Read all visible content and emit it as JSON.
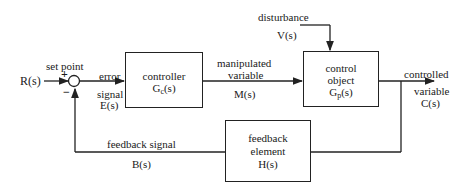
{
  "diagram": {
    "type": "feedback control block diagram",
    "input": {
      "label": "set point",
      "symbol": "R(s)"
    },
    "summing_junction": {
      "plus": "+",
      "minus": "−"
    },
    "error": {
      "line1": "error",
      "line2": "signal",
      "symbol": "E(s)"
    },
    "controller": {
      "line1": "controller",
      "symbol_main": "G",
      "symbol_sub": "c",
      "symbol_tail": "(s)"
    },
    "manipulated": {
      "line1": "manipulated",
      "line2": "variable",
      "symbol": "M(s)"
    },
    "disturbance": {
      "label": "disturbance",
      "symbol": "V(s)"
    },
    "plant": {
      "line1": "control",
      "line2": "object",
      "symbol_main": "G",
      "symbol_sub": "p",
      "symbol_tail": "(s)"
    },
    "output": {
      "line1": "controlled",
      "line2": "variable",
      "symbol": "C(s)"
    },
    "feedback_element": {
      "line1": "feedback",
      "line2": "element",
      "symbol": "H(s)"
    },
    "feedback_signal": {
      "label": "feedback signal",
      "symbol": "B(s)"
    }
  }
}
